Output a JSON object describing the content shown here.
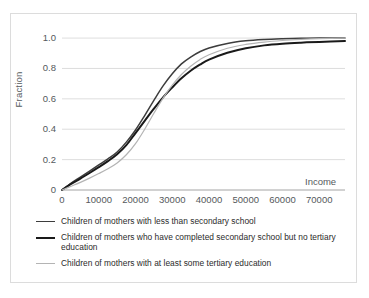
{
  "chart_data": {
    "type": "line",
    "title": "",
    "xlabel": "Income",
    "ylabel": "Fraction",
    "xlim": [
      0,
      77000
    ],
    "ylim": [
      0,
      1.04
    ],
    "grid": true,
    "legend_position": "below",
    "x_ticks": [
      "0",
      "10000",
      "20000",
      "30000",
      "40000",
      "50000",
      "60000",
      "70000"
    ],
    "x_tick_values": [
      0,
      10000,
      20000,
      30000,
      40000,
      50000,
      60000,
      70000
    ],
    "y_ticks": [
      "0",
      "0.2",
      "0.4",
      "0.6",
      "0.8",
      "1.0"
    ],
    "y_tick_values": [
      0,
      0.2,
      0.4,
      0.6,
      0.8,
      1.0
    ],
    "x": [
      0,
      2500,
      5000,
      7500,
      10000,
      12500,
      15000,
      17500,
      20000,
      22500,
      25000,
      27500,
      30000,
      32500,
      35000,
      37500,
      40000,
      45000,
      50000,
      55000,
      60000,
      65000,
      70000,
      77000
    ],
    "series": [
      {
        "name": "Children of mothers with less than secondary school",
        "color": "#3d3d3d",
        "width": 1.5,
        "values": [
          0.0,
          0.045,
          0.085,
          0.125,
          0.165,
          0.205,
          0.25,
          0.315,
          0.395,
          0.49,
          0.59,
          0.685,
          0.765,
          0.83,
          0.875,
          0.91,
          0.935,
          0.965,
          0.982,
          0.991,
          0.996,
          0.999,
          1.0,
          1.0
        ]
      },
      {
        "name": "Children of mothers who have completed secondary school but no tertiary education",
        "color": "#1a1a1a",
        "width": 2.0,
        "values": [
          0.0,
          0.04,
          0.075,
          0.112,
          0.15,
          0.19,
          0.235,
          0.295,
          0.375,
          0.455,
          0.535,
          0.61,
          0.675,
          0.735,
          0.785,
          0.825,
          0.858,
          0.903,
          0.933,
          0.952,
          0.963,
          0.97,
          0.975,
          0.98
        ]
      },
      {
        "name": "Children of mothers with at least some tertiary education",
        "color": "#b4b4b4",
        "width": 1.2,
        "values": [
          0.0,
          0.025,
          0.05,
          0.078,
          0.108,
          0.14,
          0.178,
          0.232,
          0.305,
          0.4,
          0.505,
          0.605,
          0.69,
          0.76,
          0.815,
          0.858,
          0.89,
          0.933,
          0.958,
          0.974,
          0.984,
          0.991,
          0.996,
          1.0
        ]
      }
    ]
  },
  "legend": [
    {
      "label": "Children of mothers with less than secondary school"
    },
    {
      "label": "Children of mothers who have completed secondary school but no tertiary education"
    },
    {
      "label": "Children of mothers with at least some tertiary education"
    }
  ]
}
